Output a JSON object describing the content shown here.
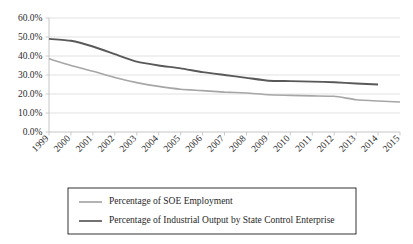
{
  "chart_data": {
    "type": "line",
    "title": "",
    "subtitle": "",
    "xlabel": "",
    "ylabel": "",
    "x": [
      "1999",
      "2000",
      "2001",
      "2002",
      "2003",
      "2004",
      "2005",
      "2006",
      "2007",
      "2008",
      "2009",
      "2010",
      "2011",
      "2012",
      "2013",
      "2014",
      "2015"
    ],
    "categories": [
      "1999",
      "2000",
      "2001",
      "2002",
      "2003",
      "2004",
      "2005",
      "2006",
      "2007",
      "2008",
      "2009",
      "2010",
      "2011",
      "2012",
      "2013",
      "2014",
      "2015"
    ],
    "ylim": [
      0,
      60
    ],
    "ytick_values": [
      0,
      10,
      20,
      30,
      40,
      50,
      60
    ],
    "ytick_labels": [
      "0.0%",
      "10.0%",
      "20.0%",
      "30.0%",
      "40.0%",
      "50.0%",
      "60.0%"
    ],
    "xtick_labels": [
      "1999",
      "2000",
      "2001",
      "2002",
      "2003",
      "2004",
      "2005",
      "2006",
      "2007",
      "2008",
      "2009",
      "2010",
      "2011",
      "2012",
      "2013",
      "2014",
      "2015"
    ],
    "grid": true,
    "grid_axis": "y",
    "legend_position": "bottom",
    "series": [
      {
        "name": "Percentage of SOE Employment",
        "color": "#a6a6a6",
        "width": 1.6,
        "values": [
          38.5,
          35.0,
          32.0,
          28.7,
          26.0,
          24.0,
          22.5,
          21.8,
          21.0,
          20.5,
          19.6,
          19.3,
          19.0,
          18.8,
          17.0,
          16.3,
          15.8
        ]
      },
      {
        "name": "Percentage of Industrial Output by State Control Enterprise",
        "color": "#595959",
        "width": 1.9,
        "values": [
          49.0,
          48.0,
          45.0,
          41.0,
          37.0,
          35.0,
          33.5,
          31.5,
          30.0,
          28.5,
          27.0,
          26.8,
          26.5,
          26.2,
          25.5,
          25.0,
          null
        ]
      }
    ]
  },
  "legend": {
    "entries": [
      {
        "label": "Percentage of SOE Employment",
        "color": "#a6a6a6"
      },
      {
        "label": "Percentage of Industrial Output by State Control Enterprise",
        "color": "#595959"
      }
    ]
  },
  "axis": {
    "y_labels": [
      "60.0%",
      "50.0%",
      "40.0%",
      "30.0%",
      "20.0%",
      "10.0%",
      "0.0%"
    ],
    "x_labels": [
      "1999",
      "2000",
      "2001",
      "2002",
      "2003",
      "2004",
      "2005",
      "2006",
      "2007",
      "2008",
      "2009",
      "2010",
      "2011",
      "2012",
      "2013",
      "2014",
      "2015"
    ]
  }
}
